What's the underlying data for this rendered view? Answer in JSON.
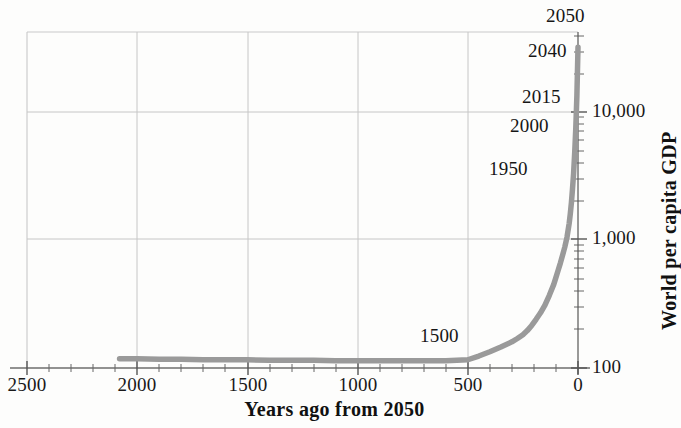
{
  "chart_data": {
    "type": "line",
    "title": "",
    "subtitle": "",
    "xlabel": "Years ago from 2050",
    "ylabel": "World per capita GDP",
    "xlim": [
      2500,
      0
    ],
    "ylim": [
      100,
      50000
    ],
    "yscale": "log",
    "xscale": "linear",
    "grid": true,
    "legend": "none",
    "x_ticks": [
      "2500",
      "2000",
      "1500",
      "1000",
      "500",
      "0"
    ],
    "x_tick_values": [
      2500,
      2000,
      1500,
      1000,
      500,
      0
    ],
    "x_minor_tick_interval": 100,
    "y_ticks": [
      "10,000",
      "1,000",
      "100"
    ],
    "y_tick_values": [
      10000,
      1000,
      100
    ],
    "y_axis_position": "right",
    "x_axis_direction": "reversed",
    "series": [
      {
        "name": "World per capita GDP",
        "color": "#9a9a9a",
        "x": [
          2080,
          2000,
          1900,
          1800,
          1700,
          1600,
          1500,
          1400,
          1300,
          1200,
          1100,
          1000,
          900,
          800,
          700,
          650,
          600,
          550,
          500,
          450,
          400,
          350,
          300,
          275,
          250,
          230,
          210,
          190,
          170,
          150,
          130,
          110,
          100,
          90,
          80,
          70,
          60,
          50,
          40,
          35,
          30,
          25,
          20,
          15,
          10,
          5,
          0
        ],
        "y": [
          118,
          118,
          117,
          117,
          116,
          116,
          116,
          115,
          115,
          115,
          114,
          114,
          114,
          114,
          114,
          114,
          114,
          115,
          116,
          124,
          134,
          146,
          160,
          170,
          182,
          196,
          215,
          240,
          270,
          310,
          370,
          450,
          510,
          580,
          660,
          760,
          880,
          1050,
          1350,
          1600,
          1950,
          2500,
          3300,
          4800,
          7500,
          13500,
          32000
        ]
      }
    ],
    "annotations": [
      {
        "label": "1500",
        "x": 550,
        "y": 120,
        "years_ago": 550
      },
      {
        "label": "1950",
        "x": 100,
        "y": 510,
        "years_ago": 100
      },
      {
        "label": "2000",
        "x": 50,
        "y": 1050,
        "years_ago": 50
      },
      {
        "label": "2015",
        "x": 35,
        "y": 1600,
        "years_ago": 35
      },
      {
        "label": "2040",
        "x": 10,
        "y": 7500,
        "years_ago": 10
      },
      {
        "label": "2050",
        "x": 0,
        "y": 32000,
        "years_ago": 0
      }
    ],
    "colors": {
      "line": "#9a9a9a",
      "grid": "#c9c9c9",
      "axis": "#6e6e6e",
      "text": "#161616",
      "background": "#fdfdfc"
    }
  }
}
